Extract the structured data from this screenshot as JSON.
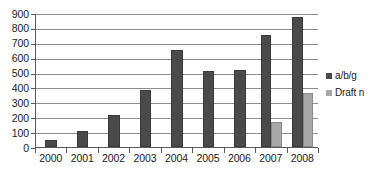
{
  "chart_data": {
    "type": "bar",
    "title": "",
    "subtitle": "",
    "xlabel": "",
    "ylabel": "",
    "categories": [
      "2000",
      "2001",
      "2002",
      "2003",
      "2004",
      "2005",
      "2006",
      "2007",
      "2008"
    ],
    "series": [
      {
        "name": "a/b/g",
        "color": "#4a4a4a",
        "values": [
          50,
          110,
          215,
          380,
          650,
          510,
          515,
          750,
          870
        ]
      },
      {
        "name": "Draft n",
        "color": "#a8a8a8",
        "values": [
          0,
          0,
          0,
          0,
          0,
          0,
          0,
          170,
          360
        ]
      }
    ],
    "ylim": [
      0,
      900
    ],
    "ytick_step": 100,
    "yticks": [
      "0",
      "100",
      "200",
      "300",
      "400",
      "500",
      "600",
      "700",
      "800",
      "900"
    ],
    "grid": true,
    "grid_axis": "y",
    "legend_position": "right",
    "bar_mode": "grouped"
  },
  "legend": {
    "entries": [
      {
        "label": "a/b/g",
        "swatch": "legend-swatch-dark"
      },
      {
        "label": "Draft n",
        "swatch": "legend-swatch-light"
      }
    ]
  }
}
